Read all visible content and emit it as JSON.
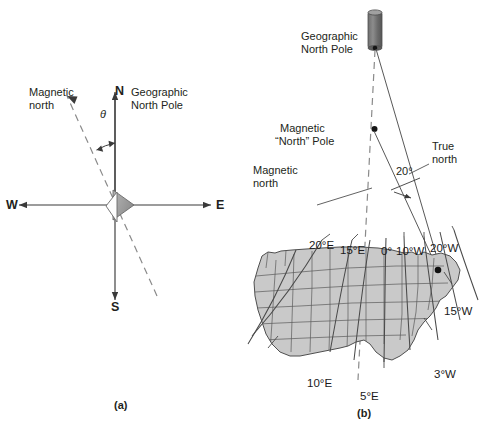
{
  "figure": {
    "background": "#ffffff",
    "line_color": "#58595b",
    "dark_line_color": "#231f20",
    "map_fill": "#c9c9c9",
    "map_stroke": "#595959",
    "pole_fill": "#7c7c7c",
    "needle_fill": "#9d9d9d"
  },
  "panel_a": {
    "tag": "(a)",
    "compass": {
      "north_letter": "N",
      "south_letter": "S",
      "east_letter": "E",
      "west_letter": "W"
    },
    "labels": {
      "magnetic_north_line1": "Magnetic",
      "magnetic_north_line2": "north",
      "geographic_line1": "Geographic",
      "geographic_line2": "North Pole",
      "angle_symbol": "θ"
    }
  },
  "panel_b": {
    "tag": "(b)",
    "labels": {
      "geographic_pole_line1": "Geographic",
      "geographic_pole_line2": "North Pole",
      "magnetic_pole_line1": "Magnetic",
      "magnetic_pole_line2": "“North” Pole",
      "magnetic_north_line1": "Magnetic",
      "magnetic_north_line2": "north",
      "true_north_line1": "True",
      "true_north_line2": "north",
      "angle": "20°"
    },
    "map": {
      "declination_labels": [
        {
          "text": "20°E"
        },
        {
          "text": "15°E"
        },
        {
          "text": "0°"
        },
        {
          "text": "10°W"
        },
        {
          "text": "20°W"
        },
        {
          "text": "15°W"
        },
        {
          "text": "3°W"
        },
        {
          "text": "10°E"
        },
        {
          "text": "5°E"
        }
      ]
    }
  }
}
